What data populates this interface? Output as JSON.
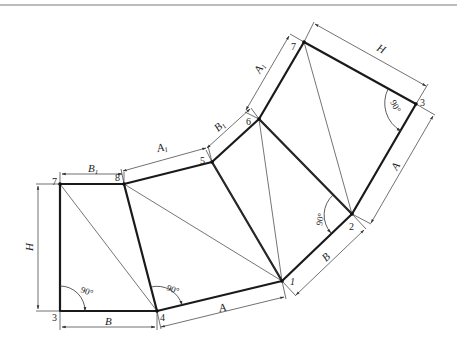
{
  "diagram": {
    "colors": {
      "outline": "#1a1a1a",
      "thin": "#3a3a3a",
      "dim": "#333333",
      "top_rule": "#7a7a7a",
      "background": "#ffffff"
    },
    "vertices": {
      "p3_left": [
        60,
        311
      ],
      "p4": [
        157,
        311
      ],
      "p7_left": [
        60,
        184
      ],
      "p8": [
        124,
        184
      ],
      "p5": [
        212,
        162
      ],
      "p6": [
        259,
        119
      ],
      "p7_top": [
        304,
        42
      ],
      "p3_top": [
        416,
        104
      ],
      "p2": [
        352,
        214
      ],
      "p1": [
        282,
        281
      ]
    },
    "point_labels": [
      {
        "id": "3-left",
        "text": "3",
        "x": 52,
        "y": 321
      },
      {
        "id": "4",
        "text": "4",
        "x": 160,
        "y": 321
      },
      {
        "id": "7-left",
        "text": "7",
        "x": 52,
        "y": 185
      },
      {
        "id": "8",
        "text": "8",
        "x": 115,
        "y": 181
      },
      {
        "id": "5",
        "text": "5",
        "x": 200,
        "y": 164
      },
      {
        "id": "6",
        "text": "6",
        "x": 246,
        "y": 125
      },
      {
        "id": "7-top",
        "text": "7",
        "x": 291,
        "y": 50
      },
      {
        "id": "3-top",
        "text": "3",
        "x": 420,
        "y": 106
      },
      {
        "id": "2",
        "text": "2",
        "x": 349,
        "y": 230
      },
      {
        "id": "1",
        "text": "1",
        "x": 290,
        "y": 285
      }
    ],
    "dimension_labels": [
      {
        "id": "B1-left",
        "text": "B",
        "sub": "1",
        "x": 88,
        "y": 172,
        "rot": 0
      },
      {
        "id": "A1-mid",
        "text": "A",
        "sub": "1",
        "x": 158,
        "y": 152,
        "rot": -14
      },
      {
        "id": "B1-right",
        "text": "B",
        "sub": "1",
        "x": 218,
        "y": 132,
        "rot": -42
      },
      {
        "id": "A1-top",
        "text": "A",
        "sub": "1",
        "x": 260,
        "y": 74,
        "rot": -60
      },
      {
        "id": "H-top",
        "text": "H",
        "sub": "",
        "x": 376,
        "y": 50,
        "rot": 29
      },
      {
        "id": "A-right",
        "text": "A",
        "sub": "",
        "x": 397,
        "y": 171,
        "rot": -60
      },
      {
        "id": "B-right",
        "text": "B",
        "sub": "",
        "x": 326,
        "y": 262,
        "rot": -44
      },
      {
        "id": "A-bottom",
        "text": "A",
        "sub": "",
        "x": 220,
        "y": 312,
        "rot": -14
      },
      {
        "id": "B-bottom",
        "text": "B",
        "sub": "",
        "x": 105,
        "y": 329,
        "rot": 0
      },
      {
        "id": "H-left",
        "text": "H",
        "sub": "",
        "x": 34,
        "y": 251,
        "rot": -90
      }
    ],
    "angle_labels": [
      {
        "id": "angle-3-left",
        "text": "90°",
        "x": 86,
        "y": 290,
        "rot": 20
      },
      {
        "id": "angle-4",
        "text": "90°",
        "x": 174,
        "y": 289,
        "rot": 20
      },
      {
        "id": "angle-2",
        "text": "90°",
        "x": 320,
        "y": 220,
        "rot": -80
      },
      {
        "id": "angle-3-top",
        "text": "90°",
        "x": 392,
        "y": 110,
        "rot": 62
      }
    ]
  }
}
